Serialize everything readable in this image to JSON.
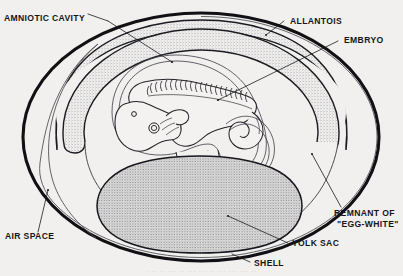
{
  "figure": {
    "background_color": "#f1f0ee",
    "ink_color": "#15141a",
    "stipple_color": "#8d8d92"
  },
  "labels": {
    "amniotic_cavity": "AMNIOTIC CAVITY",
    "allantois": "ALLANTOIS",
    "embryo": "EMBRYO",
    "remnant_line1": "REMNANT OF",
    "remnant_line2": "\"EGG-WHITE\"",
    "yolk_sac": "YOLK SAC",
    "shell": "SHELL",
    "air_space": "AIR SPACE"
  },
  "caption": {
    "partial_text": "· ·· ·· ··· ·· ··· ··· ·· ··· ··· ··· ··"
  },
  "parts": [
    {
      "id": "shell",
      "name": "SHELL",
      "description": "outer thick black egg outline"
    },
    {
      "id": "air-space",
      "name": "AIR SPACE",
      "description": "gap between shell and shell membrane at left pole"
    },
    {
      "id": "allantois",
      "name": "ALLANTOIS",
      "description": "stippled band lining the inside of the shell"
    },
    {
      "id": "amniotic-cavity",
      "name": "AMNIOTIC CAVITY",
      "description": "clear space within the amnion around the embryo"
    },
    {
      "id": "embryo",
      "name": "EMBRYO",
      "description": "curled chick embryo with somites, eye and limb buds"
    },
    {
      "id": "yolk-sac",
      "name": "YOLK SAC",
      "description": "large stippled oval below the embryo"
    },
    {
      "id": "egg-white-remnant",
      "name": "REMNANT OF \"EGG-WHITE\"",
      "description": "clear region at right of the egg interior"
    }
  ]
}
